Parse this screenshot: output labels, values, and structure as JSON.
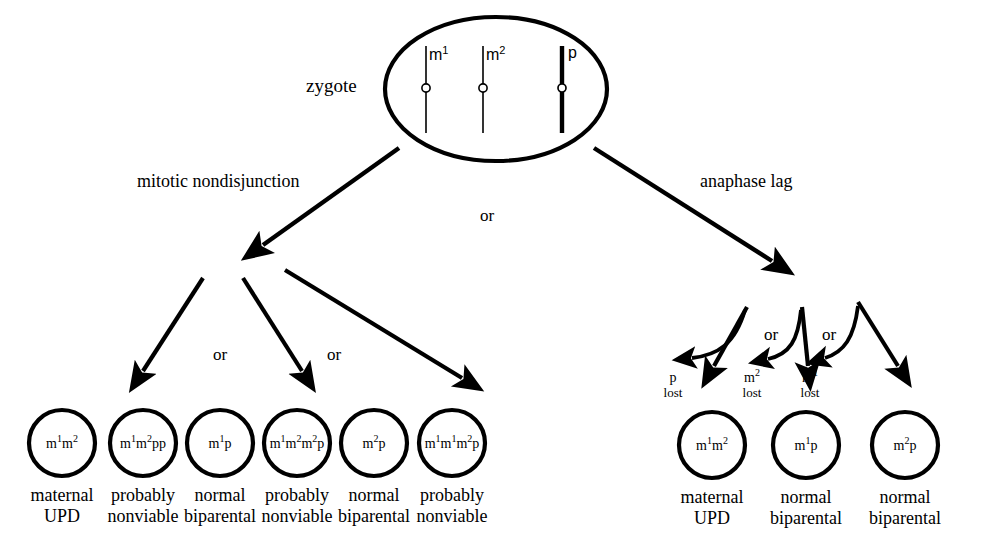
{
  "figure": {
    "zygote_label": "zygote",
    "branches": [
      {
        "name": "mitotic-nondisjunction",
        "label": "mitotic nondisjunction"
      },
      {
        "name": "anaphase-lag",
        "label": "anaphase lag"
      }
    ],
    "or_label": "or",
    "zygote_chromosomes": [
      {
        "name": "m1",
        "label": "m",
        "superscript": "1",
        "origin": "maternal",
        "style": "thin"
      },
      {
        "name": "m2",
        "label": "m",
        "superscript": "2",
        "origin": "maternal",
        "style": "thin"
      },
      {
        "name": "p",
        "label": "p",
        "superscript": "",
        "origin": "paternal",
        "style": "thick"
      }
    ],
    "mitotic_outcomes": [
      {
        "genotype": "m<sup>1</sup>m<sup>2</sup>",
        "line1": "maternal",
        "line2": "UPD"
      },
      {
        "genotype": "m<sup>1</sup>m<sup>2</sup>pp",
        "line1": "probably",
        "line2": "nonviable"
      },
      {
        "genotype": "m<sup>1</sup>p",
        "line1": "normal",
        "line2": "biparental"
      },
      {
        "genotype": "m<sup>1</sup>m<sup>2</sup>m<sup>2</sup>p",
        "line1": "probably",
        "line2": "nonviable"
      },
      {
        "genotype": "m<sup>2</sup>p",
        "line1": "normal",
        "line2": "biparental"
      },
      {
        "genotype": "m<sup>1</sup>m<sup>1</sup>m<sup>2</sup>p",
        "line1": "probably",
        "line2": "nonviable"
      }
    ],
    "anaphase_outcomes": [
      {
        "lost": "p",
        "lost_sup": "",
        "lost_word": "lost",
        "genotype": "m<sup>1</sup>m<sup>2</sup>",
        "line1": "maternal",
        "line2": "UPD"
      },
      {
        "lost": "m",
        "lost_sup": "2",
        "lost_word": "lost",
        "genotype": "m<sup>1</sup>p",
        "line1": "normal",
        "line2": "biparental"
      },
      {
        "lost": "m",
        "lost_sup": "1",
        "lost_word": "lost",
        "genotype": "m<sup>2</sup>p",
        "line1": "normal",
        "line2": "biparental"
      }
    ],
    "or_markers_mitotic": [
      "or",
      "or"
    ],
    "or_markers_anaphase": [
      "or",
      "or"
    ],
    "colors": {
      "stroke": "#000000",
      "background": "#ffffff"
    }
  }
}
